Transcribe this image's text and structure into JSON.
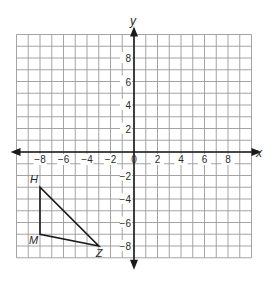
{
  "chart_data": {
    "type": "scatter",
    "title": "",
    "xlabel": "x",
    "ylabel": "y",
    "xlim": [
      -10,
      10
    ],
    "ylim": [
      -9,
      10
    ],
    "grid": true,
    "x_tick_labels": [
      "-8",
      "-6",
      "-4",
      "-2",
      "0",
      "2",
      "4",
      "6",
      "8"
    ],
    "y_tick_labels": [
      "8",
      "6",
      "4",
      "2",
      "-2",
      "-4",
      "-6",
      "-8"
    ],
    "shapes": [
      {
        "type": "triangle",
        "vertices": [
          {
            "label": "H",
            "x": -8,
            "y": -3
          },
          {
            "label": "M",
            "x": -8,
            "y": -7
          },
          {
            "label": "Z",
            "x": -3,
            "y": -8
          }
        ]
      }
    ]
  },
  "labels": {
    "x_axis": "x",
    "y_axis": "y",
    "origin": "0"
  },
  "colors": {
    "grid": "#9a9a9a",
    "axis": "#1a1a1a",
    "shape": "#1a1a1a",
    "text": "#2a2a2a"
  }
}
